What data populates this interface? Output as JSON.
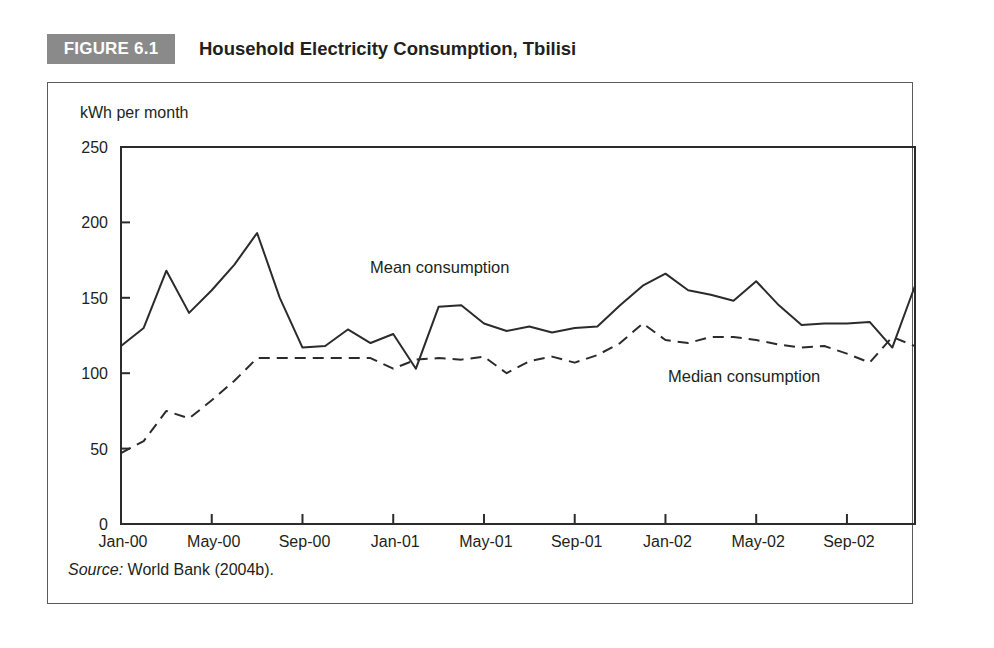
{
  "figure": {
    "tag": "FIGURE 6.1",
    "title": "Household Electricity Consumption, Tbilisi",
    "tag_bg_color": "#8a8a8a",
    "frame_color": "#5a5a5a"
  },
  "source": {
    "label": "Source:",
    "text": "World Bank (2004b)."
  },
  "chart_data": {
    "type": "line",
    "title": "Household Electricity Consumption, Tbilisi",
    "xlabel": "",
    "ylabel": "kWh per month",
    "ylim": [
      0,
      250
    ],
    "yticks": [
      0,
      50,
      100,
      150,
      200,
      250
    ],
    "ytick_labels": [
      "0",
      "50",
      "100",
      "150",
      "200",
      "250"
    ],
    "grid": false,
    "legend": "inline-annotations",
    "x": [
      "Jan-00",
      "Feb-00",
      "Mar-00",
      "Apr-00",
      "May-00",
      "Jun-00",
      "Jul-00",
      "Aug-00",
      "Sep-00",
      "Oct-00",
      "Nov-00",
      "Dec-00",
      "Jan-01",
      "Feb-01",
      "Mar-01",
      "Apr-01",
      "May-01",
      "Jun-01",
      "Jul-01",
      "Aug-01",
      "Sep-01",
      "Oct-01",
      "Nov-01",
      "Dec-01",
      "Jan-02",
      "Feb-02",
      "Mar-02",
      "Apr-02",
      "May-02",
      "Jun-02",
      "Jul-02",
      "Aug-02",
      "Sep-02",
      "Oct-02",
      "Nov-02",
      "Dec-02"
    ],
    "xtick_labels": [
      "Jan-00",
      "May-00",
      "Sep-00",
      "Jan-01",
      "May-01",
      "Sep-01",
      "Jan-02",
      "May-02",
      "Sep-02"
    ],
    "xtick_indices": [
      0,
      4,
      8,
      12,
      16,
      20,
      24,
      28,
      32
    ],
    "series": [
      {
        "name": "Mean consumption",
        "style": "solid",
        "annotation": "Mean consumption",
        "values": [
          118,
          130,
          168,
          140,
          155,
          172,
          193,
          150,
          117,
          118,
          129,
          120,
          126,
          103,
          144,
          145,
          133,
          128,
          131,
          127,
          130,
          131,
          145,
          158,
          166,
          155,
          152,
          148,
          161,
          145,
          132,
          133,
          133,
          134,
          117,
          158
        ]
      },
      {
        "name": "Median consumption",
        "style": "dashed",
        "annotation": "Median consumption",
        "values": [
          47,
          55,
          75,
          70,
          82,
          95,
          110,
          110,
          110,
          110,
          110,
          110,
          103,
          109,
          110,
          109,
          111,
          100,
          108,
          111,
          107,
          112,
          120,
          133,
          122,
          120,
          124,
          124,
          122,
          119,
          117,
          118,
          113,
          107,
          124,
          118
        ]
      }
    ]
  }
}
